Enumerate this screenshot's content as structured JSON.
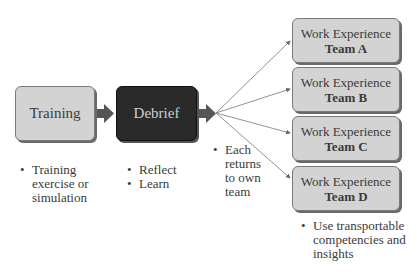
{
  "diagram": {
    "stages": [
      {
        "id": "training",
        "label": "Training",
        "style": "light",
        "bullets": [
          "Training exercise or simulation"
        ]
      },
      {
        "id": "debrief",
        "label": "Debrief",
        "style": "dark",
        "bullets": [
          "Reflect",
          "Learn"
        ]
      }
    ],
    "fanout_note": {
      "bullets": [
        "Each returns to own team"
      ]
    },
    "teams": [
      {
        "title": "Work Experience",
        "team": "Team A"
      },
      {
        "title": "Work Experience",
        "team": "Team B"
      },
      {
        "title": "Work Experience",
        "team": "Team C"
      },
      {
        "title": "Work Experience",
        "team": "Team D"
      }
    ],
    "teams_note": {
      "bullets": [
        "Use transportable competencies and insights"
      ]
    },
    "colors": {
      "light_box": "#d3d3d3",
      "dark_box": "#2a2a2a",
      "arrow": "#555555",
      "connector": "#777777"
    }
  }
}
